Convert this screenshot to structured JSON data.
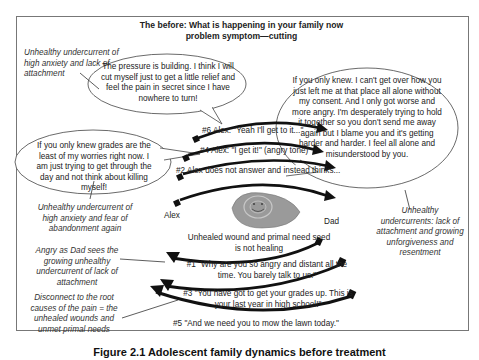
{
  "title": {
    "line1": "The before: What is happening in your family now",
    "line2": "problem symptom—cutting"
  },
  "notes": {
    "top_left": "Unhealthy undercurrent of high anxiety and lack of attachment",
    "mid_left": "Unhealthy undercurrent of high anxiety and fear of abandonment again",
    "angry_dad": "Angry as Dad sees the growing unhealthy undercurrent of lack of attachment",
    "disconnect": "Disconnect to the root causes of the pain = the unhealed wounds and unmet primal needs",
    "right": "Unhealthy undercurrents: lack of attachment and growing unforgiveness and resentment"
  },
  "bubbles": {
    "pressure": "The pressure is building. I think I will cut myself just to get a little relief and feel the pain in secret since I have nowhere to turn!",
    "grades": "If you only knew grades are the least of my worries right now. I am just trying to get through the day and not think about killing myself!",
    "dad_left": "If you only knew.  I can't get over how you just left me at that place all alone without my consent. And I only got worse and more angry. I'm desperately trying to hold it together so you don't send me away again but I blame you and it's getting harder and harder. I feel all alone and misunderstood by you."
  },
  "exchanges": {
    "six": "#6  Alex: \"Yeah I'll get to it...\"",
    "four": "#4 Alex: \"I get it!\" (angry tone)",
    "two": "#2  Alex does not answer and instead thinks...",
    "one_a": "#1  \"Why are you so angry and distant all the",
    "one_b": "time. You barely talk to us.\"",
    "three_a": "#3  \"You have got to get your grades up. This is",
    "three_b": "your last year in high school!\"",
    "five": "#5  \"And we need you to mow the lawn today.\""
  },
  "labels": {
    "alex": "Alex",
    "dad": "Dad",
    "seed_a": "Unhealed wound and primal need seed",
    "seed_b": "is not healing"
  },
  "caption": "Figure 2.1   Adolescent family dynamics before treatment",
  "colors": {
    "arrow": "#111111",
    "seed": "#9a9a9a",
    "border": "#777777"
  }
}
